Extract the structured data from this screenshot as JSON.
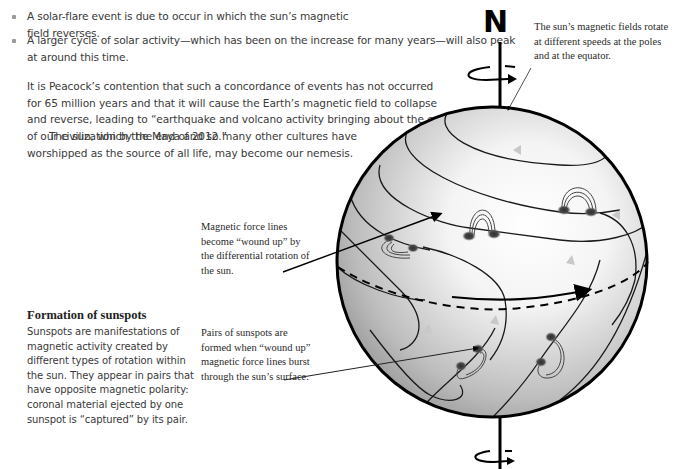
{
  "bullets": [
    "A solar-flare event is due to occur in which the sun’s magnetic field reverses.",
    "A larger cycle of solar activity—which has been on the increase for many years—will also peak at around this time."
  ],
  "paragraphs": [
    "It is Peacock’s contention that such a concordance of events has not occurred for 65 million years and that it will cause the Earth’s magnetic field to collapse and reverse, leading to “earthquake and volcano activity bringing about the end of our civilization by the end of 2012.”",
    "The sun, which the Maya and so many other cultures have worshipped as the source of all life, may become our nemesis."
  ],
  "diagram": {
    "north_label": "N",
    "callouts": {
      "poles": "The sun’s magnetic fields rotate at different speeds at the poles and at the equator.",
      "wound_up": "Magnetic force lines become “wound up” by the differential rotation of the sun.",
      "pairs": "Pairs of sunspots are formed when “wound up” magnetic force lines burst through the sun’s surface."
    },
    "colors": {
      "sphere_light": "#ffffff",
      "sphere_dark": "#8c8c8c",
      "outline": "#000000",
      "sunspot": "#3c3c3c",
      "arrow_light": "#c8c8c8"
    }
  },
  "sidebar": {
    "heading": "Formation of sunspots",
    "body": "Sunspots are manifestations of magnetic activity created by different types of rotation within the sun. They appear in pairs that have opposite magnetic polarity: coronal material ejected by one sunspot is “captured” by its pair."
  }
}
